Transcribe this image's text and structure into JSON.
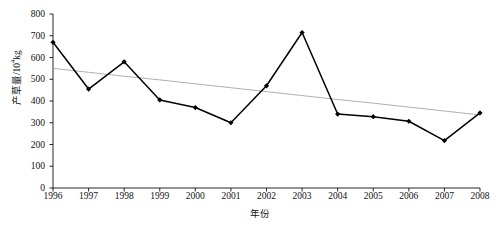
{
  "chart_data": {
    "type": "line",
    "title": "",
    "xlabel": "年份",
    "ylabel_prefix": "产草量/10",
    "ylabel_exponent": "4",
    "ylabel_suffix": "kg",
    "ylabel_full": "产草量/10⁴kg",
    "categories": [
      "1996",
      "1997",
      "1998",
      "1999",
      "2000",
      "2001",
      "2002",
      "2003",
      "2004",
      "2005",
      "2006",
      "2007",
      "2008"
    ],
    "x": [
      1996,
      1997,
      1998,
      1999,
      2000,
      2001,
      2002,
      2003,
      2004,
      2005,
      2006,
      2007,
      2008
    ],
    "series": [
      {
        "name": "产草量",
        "values": [
          670,
          455,
          580,
          405,
          370,
          300,
          470,
          715,
          340,
          328,
          307,
          218,
          345
        ],
        "marker": "filled-diamond",
        "color": "#000000"
      },
      {
        "name": "线性趋势线",
        "type": "trend",
        "values": [
          550,
          532,
          514,
          497,
          479,
          461,
          443,
          425,
          407,
          390,
          372,
          354,
          336
        ],
        "color": "#9a9a9a"
      }
    ],
    "ylim": [
      0,
      800
    ],
    "yticks": [
      0,
      100,
      200,
      300,
      400,
      500,
      600,
      700,
      800
    ],
    "ytick_labels": [
      "0",
      "100",
      "200",
      "300",
      "400",
      "500",
      "600",
      "700",
      "800"
    ],
    "xlim": [
      1996,
      2008
    ],
    "grid": false,
    "legend": "none"
  },
  "axes": {
    "y_axis_name": "产草量轴",
    "x_axis_name": "年份轴"
  }
}
